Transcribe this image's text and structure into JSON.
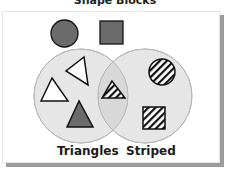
{
  "title": "Shape Blocks",
  "venn": {
    "sets": [
      {
        "label": "Triangles",
        "items": [
          "white-triangle-rotated",
          "white-triangle",
          "gray-triangle",
          "striped-triangle"
        ]
      },
      {
        "label": "Striped",
        "items": [
          "striped-triangle",
          "striped-circle",
          "striped-square"
        ]
      }
    ],
    "intersection": [
      "striped-triangle"
    ],
    "outside": [
      "gray-circle",
      "gray-square"
    ]
  },
  "colors": {
    "circle_fill": "#e0e0e0",
    "circle_stroke": "#b5b5b5",
    "shape_gray": "#6b6b6b",
    "outline": "#111111",
    "shadow": "#9c9c9c"
  },
  "labels": {
    "left": "Triangles",
    "right": "Striped"
  }
}
